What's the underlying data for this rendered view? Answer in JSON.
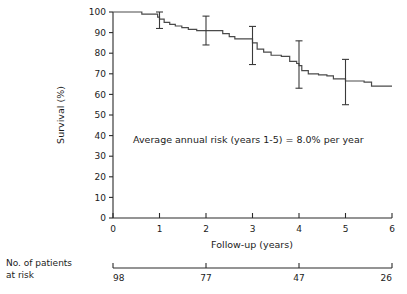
{
  "chart_data": {
    "type": "line",
    "subtype": "kaplan-meier-survival",
    "title": "",
    "xlabel": "Follow-up (years)",
    "ylabel": "Survival (%)",
    "xlim": [
      0,
      6
    ],
    "ylim": [
      0,
      100
    ],
    "grid": false,
    "legend": null,
    "xticks": [
      0,
      1,
      2,
      3,
      4,
      5,
      6
    ],
    "xtick_labels": [
      "0",
      "1",
      "2",
      "3",
      "4",
      "5",
      "6"
    ],
    "yticks": [
      0,
      10,
      20,
      30,
      40,
      50,
      60,
      70,
      80,
      90,
      100
    ],
    "ytick_labels": [
      "0",
      "10",
      "20",
      "30",
      "40",
      "50",
      "60",
      "70",
      "80",
      "90",
      "100"
    ],
    "annotations": [
      {
        "text": "Average annual risk (years 1-5) = 8.0% per year",
        "x": 1.1,
        "y": 40
      }
    ],
    "series": [
      {
        "name": "Survival",
        "step": "post",
        "points": [
          {
            "x": 0.0,
            "y": 100.0
          },
          {
            "x": 0.5,
            "y": 100.0
          },
          {
            "x": 0.62,
            "y": 99.0
          },
          {
            "x": 0.88,
            "y": 99.0
          },
          {
            "x": 0.96,
            "y": 97.5
          },
          {
            "x": 1.0,
            "y": 96.5
          },
          {
            "x": 1.1,
            "y": 95.0
          },
          {
            "x": 1.22,
            "y": 94.0
          },
          {
            "x": 1.34,
            "y": 93.2
          },
          {
            "x": 1.48,
            "y": 92.4
          },
          {
            "x": 1.62,
            "y": 91.6
          },
          {
            "x": 1.8,
            "y": 91.0
          },
          {
            "x": 2.0,
            "y": 91.0
          },
          {
            "x": 2.26,
            "y": 91.0
          },
          {
            "x": 2.36,
            "y": 89.5
          },
          {
            "x": 2.5,
            "y": 88.0
          },
          {
            "x": 2.62,
            "y": 87.0
          },
          {
            "x": 2.95,
            "y": 87.0
          },
          {
            "x": 3.0,
            "y": 85.0
          },
          {
            "x": 3.1,
            "y": 82.0
          },
          {
            "x": 3.24,
            "y": 80.5
          },
          {
            "x": 3.4,
            "y": 79.0
          },
          {
            "x": 3.62,
            "y": 78.5
          },
          {
            "x": 3.74,
            "y": 78.5
          },
          {
            "x": 3.8,
            "y": 76.0
          },
          {
            "x": 3.95,
            "y": 75.0
          },
          {
            "x": 4.0,
            "y": 74.0
          },
          {
            "x": 4.06,
            "y": 71.5
          },
          {
            "x": 4.2,
            "y": 70.0
          },
          {
            "x": 4.42,
            "y": 69.5
          },
          {
            "x": 4.6,
            "y": 69.0
          },
          {
            "x": 4.74,
            "y": 67.5
          },
          {
            "x": 5.0,
            "y": 66.5
          },
          {
            "x": 5.4,
            "y": 66.0
          },
          {
            "x": 5.56,
            "y": 64.0
          },
          {
            "x": 6.0,
            "y": 64.0
          }
        ]
      }
    ],
    "error_bars": [
      {
        "x": 1.0,
        "y": 96.5,
        "upper": 100.0,
        "lower": 92.0
      },
      {
        "x": 2.0,
        "y": 91.0,
        "upper": 98.0,
        "lower": 84.0
      },
      {
        "x": 3.0,
        "y": 85.5,
        "upper": 93.0,
        "lower": 74.5
      },
      {
        "x": 4.0,
        "y": 74.0,
        "upper": 86.0,
        "lower": 63.0
      },
      {
        "x": 5.0,
        "y": 66.0,
        "upper": 77.0,
        "lower": 55.0
      }
    ]
  },
  "risk_table": {
    "label_line1": "No. of patients",
    "label_line2": "at risk",
    "tick_positions": [
      0,
      2,
      4,
      6
    ],
    "values": [
      "98",
      "77",
      "47",
      "26"
    ]
  },
  "colors": {
    "curve": "#4a4a4a",
    "axis": "#2a2a2a",
    "text": "#1b1b1b",
    "background": "#ffffff"
  }
}
